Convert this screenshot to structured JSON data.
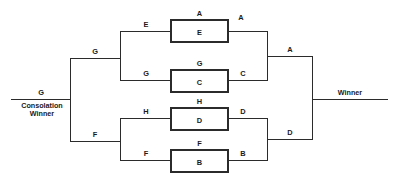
{
  "diagram": {
    "line_color": "#2b2b2b",
    "background": "#ffffff",
    "entry": {
      "label": "G",
      "name_line1": "Consolation",
      "name_line2": "Winner"
    },
    "exit": {
      "label": "Winner"
    },
    "boxes": [
      {
        "id": "box-e",
        "inside": "E",
        "above": "A"
      },
      {
        "id": "box-c",
        "inside": "C",
        "above": "G"
      },
      {
        "id": "box-d",
        "inside": "D",
        "above": "H"
      },
      {
        "id": "box-b",
        "inside": "B",
        "above": "F"
      }
    ],
    "edge_labels": {
      "upper_branch": "G",
      "lower_branch": "F",
      "e_in": "E",
      "c_in": "G",
      "d_in": "H",
      "b_in": "F",
      "e_out": "A",
      "c_out": "C",
      "d_out": "D",
      "b_out": "B",
      "upper_semi_out": "A",
      "lower_semi_out": "D"
    }
  }
}
